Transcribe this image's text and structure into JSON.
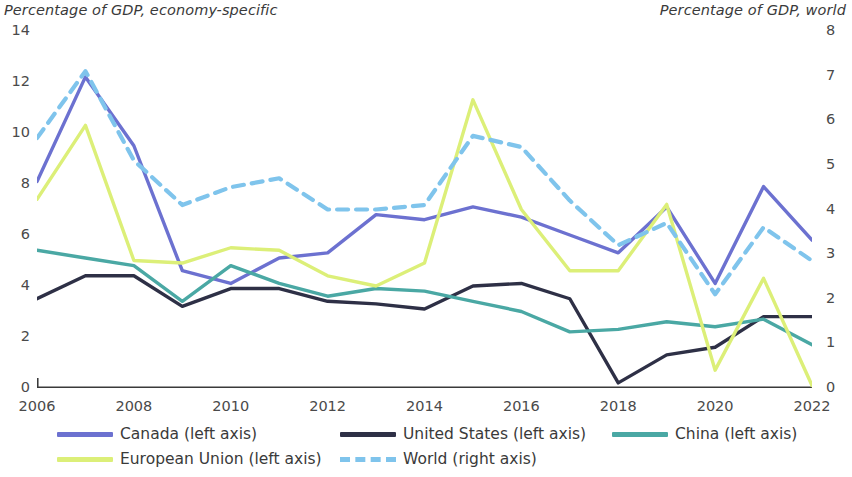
{
  "axis_titles": {
    "left": "Percentage of GDP, economy-specific",
    "right": "Percentage of GDP, world"
  },
  "legend": {
    "items": [
      {
        "label": "Canada (left axis)",
        "key": "canada",
        "color": "#6c71d0",
        "style": "solid",
        "swatch_name": "legend-swatch-canada"
      },
      {
        "label": "United States (left axis)",
        "key": "united_states",
        "color": "#2e3046",
        "style": "solid",
        "swatch_name": "legend-swatch-united-states"
      },
      {
        "label": "China (left axis)",
        "key": "china",
        "color": "#4aa8a4",
        "style": "solid",
        "swatch_name": "legend-swatch-china"
      },
      {
        "label": "European Union (left axis)",
        "key": "european_union",
        "color": "#dcef78",
        "style": "solid",
        "swatch_name": "legend-swatch-european-union"
      },
      {
        "label": "World (right axis)",
        "key": "world",
        "color": "#7fc4ec",
        "style": "dashed",
        "swatch_name": "legend-swatch-world"
      }
    ]
  },
  "axes": {
    "y_left": {
      "min": 0,
      "max": 14,
      "step": 2,
      "ticks": [
        "0",
        "2",
        "4",
        "6",
        "8",
        "10",
        "12",
        "14"
      ]
    },
    "y_right": {
      "min": 0,
      "max": 8,
      "step": 1,
      "ticks": [
        "0",
        "1",
        "2",
        "3",
        "4",
        "5",
        "6",
        "7",
        "8"
      ]
    },
    "x": {
      "min": 2006,
      "max": 2022,
      "tick_step": 2,
      "ticks": [
        "2006",
        "2008",
        "2010",
        "2012",
        "2014",
        "2016",
        "2018",
        "2020",
        "2022"
      ]
    }
  },
  "chart_data": {
    "type": "line",
    "title": "",
    "subtitle": "",
    "xlabel": "",
    "ylabel": "Percentage of GDP, economy-specific",
    "ylabel_right": "Percentage of GDP, world",
    "xlim": [
      2006,
      2022
    ],
    "ylim": [
      0,
      14
    ],
    "ylim_right": [
      0,
      8
    ],
    "grid": false,
    "legend_position": "bottom",
    "x": [
      2006,
      2007,
      2008,
      2009,
      2010,
      2011,
      2012,
      2013,
      2014,
      2015,
      2016,
      2017,
      2018,
      2019,
      2020,
      2021,
      2022
    ],
    "series": [
      {
        "name": "Canada (left axis)",
        "axis": "left",
        "color": "#6c71d0",
        "style": "solid",
        "values": [
          8.1,
          12.2,
          9.5,
          4.6,
          4.1,
          5.1,
          5.3,
          6.8,
          6.6,
          7.1,
          6.7,
          6.0,
          5.3,
          7.1,
          4.1,
          7.9,
          5.8
        ]
      },
      {
        "name": "United States (left axis)",
        "axis": "left",
        "color": "#2e3046",
        "style": "solid",
        "values": [
          3.5,
          4.4,
          4.4,
          3.2,
          3.9,
          3.9,
          3.4,
          3.3,
          3.1,
          4.0,
          4.1,
          3.5,
          0.2,
          1.3,
          1.6,
          2.8,
          2.8
        ]
      },
      {
        "name": "China (left axis)",
        "axis": "left",
        "color": "#4aa8a4",
        "style": "solid",
        "values": [
          5.4,
          5.1,
          4.8,
          3.4,
          4.8,
          4.1,
          3.6,
          3.9,
          3.8,
          3.4,
          3.0,
          2.2,
          2.3,
          2.6,
          2.4,
          2.7,
          1.7
        ]
      },
      {
        "name": "European Union (left axis)",
        "axis": "left",
        "color": "#dcef78",
        "style": "solid",
        "values": [
          7.4,
          10.3,
          5.0,
          4.9,
          5.5,
          5.4,
          4.4,
          4.0,
          4.9,
          11.3,
          7.0,
          4.6,
          4.6,
          7.2,
          0.7,
          4.3,
          0.1
        ]
      },
      {
        "name": "World (right axis)",
        "axis": "right",
        "color": "#7fc4ec",
        "style": "dashed",
        "values": [
          5.6,
          7.1,
          5.1,
          4.1,
          4.5,
          4.7,
          4.0,
          4.0,
          4.1,
          5.65,
          5.4,
          4.2,
          3.2,
          3.7,
          2.1,
          3.6,
          2.85
        ]
      }
    ]
  }
}
